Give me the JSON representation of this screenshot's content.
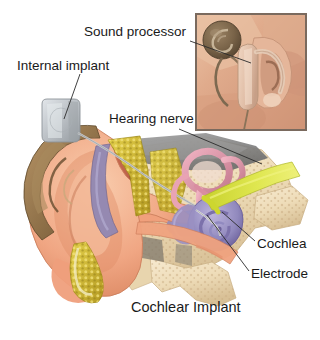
{
  "figure": {
    "title": "Cochlear Implant",
    "width": 320,
    "height": 340,
    "background": "#ffffff"
  },
  "labels": {
    "sound_processor": "Sound processor",
    "internal_implant": "Internal implant",
    "hearing_nerve": "Hearing nerve",
    "cochlea": "Cochlea",
    "electrode": "Electrode"
  },
  "leader_lines": [
    {
      "name": "sound-processor-leader",
      "from": [
        190,
        41
      ],
      "to": [
        251,
        63
      ]
    },
    {
      "name": "internal-implant-leader",
      "from": [
        80,
        74
      ],
      "to": [
        64,
        119
      ]
    },
    {
      "name": "hearing-nerve-leader",
      "from": [
        179,
        129
      ],
      "to": [
        262,
        164
      ]
    },
    {
      "name": "cochlea-leader",
      "from": [
        255,
        241
      ],
      "to": [
        222,
        212
      ]
    },
    {
      "name": "electrode-leader",
      "from": [
        249,
        271
      ],
      "to": [
        207,
        215
      ]
    }
  ],
  "inset": {
    "name": "external-device-photo",
    "x": 195,
    "y": 13,
    "width": 112,
    "height": 118,
    "border_color": "#7a6a5e",
    "skin_color": "#e3b79a",
    "parts": [
      "sound-processor-coil",
      "behind-the-ear-processor",
      "ear",
      "cable"
    ]
  },
  "colors": {
    "text": "#1a1a1a",
    "leader_line": "#2b2b2b",
    "skin": "#f0ab88",
    "skin_light": "#f7c9ad",
    "skin_shadow": "#d98e6c",
    "ear_helix": "#9a7a52",
    "ear_helix_dark": "#7a5c38",
    "bone": "#f2e0c0",
    "bone_shadow": "#d9c49c",
    "fat_yellow": "#d8c23c",
    "fat_yellow_dark": "#b8a02a",
    "cochlea_purple": "#9a8fc4",
    "cochlea_purple_dark": "#6f639e",
    "canal_pink": "#e79db0",
    "canal_pink_dark": "#c4788d",
    "nerve_yellow": "#d8e03a",
    "mastoid_gray": "#8e8e8e",
    "implant_gray": "#b8bcc0",
    "implant_gray_light": "#d8dce0",
    "canal_red": "#b5503a",
    "eardrum_mauve": "#8b7ba0"
  },
  "anatomy_parts": [
    "outer-ear-pinna",
    "ear-canal",
    "eardrum",
    "temporal-bone",
    "mastoid",
    "cochlea",
    "semicircular-canals",
    "auditory-nerve",
    "internal-implant-device",
    "electrode-array"
  ]
}
